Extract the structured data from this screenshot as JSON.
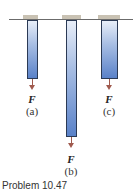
{
  "figure": {
    "bars": [
      {
        "id": "a",
        "label": "(a)",
        "force": "F"
      },
      {
        "id": "b",
        "label": "(b)",
        "force": "F"
      },
      {
        "id": "c",
        "label": "(c)",
        "force": "F"
      }
    ],
    "caption": "Problem 10.47"
  },
  "colors": {
    "bar_fill_dark": "#5a82c9",
    "bar_fill_light": "#e8eef8",
    "arrow": "#a05a4e",
    "support": "#c9c2b3"
  }
}
